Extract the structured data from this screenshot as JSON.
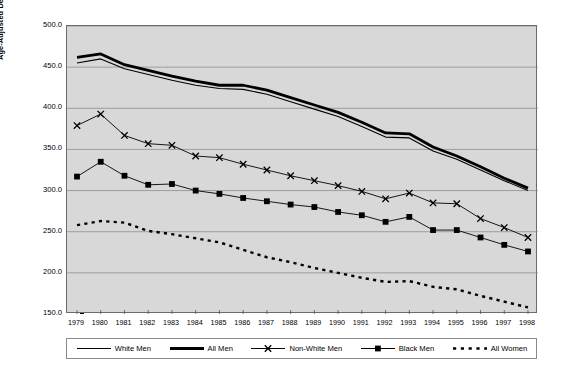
{
  "chart_data": {
    "type": "line",
    "title": "",
    "xlabel": "",
    "ylabel": "Age-Adjusted Death Rate per 100,000 Population",
    "x": [
      1979,
      1980,
      1981,
      1982,
      1983,
      1984,
      1985,
      1986,
      1987,
      1988,
      1989,
      1990,
      1991,
      1992,
      1993,
      1994,
      1995,
      1996,
      1997,
      1998
    ],
    "xtick_labels": [
      "1979",
      "1980",
      "1981",
      "1982",
      "1983",
      "1984",
      "1985",
      "1986",
      "1987",
      "1988",
      "1989",
      "1990",
      "1991",
      "1992",
      "1993",
      "1994",
      "1995",
      "1996",
      "1997",
      "1998"
    ],
    "ytick_labels": [
      "500.0",
      "450.0",
      "400.0",
      "350.0",
      "300.0",
      "250.0",
      "200.0",
      "150.0"
    ],
    "ytick_values": [
      500,
      450,
      400,
      350,
      300,
      250,
      200,
      150
    ],
    "ylim": [
      150,
      500
    ],
    "xlim": [
      1979,
      1998
    ],
    "grid": "horizontal",
    "legend_position": "bottom",
    "plot_background": "#d8d8d8",
    "series": [
      {
        "name": "White Men",
        "style": "thin-line",
        "color": "#000000",
        "values": [
          455,
          460,
          448,
          441,
          434,
          428,
          424,
          423,
          417,
          408,
          399,
          390,
          378,
          365,
          364,
          348,
          338,
          325,
          312,
          300
        ]
      },
      {
        "name": "All Men",
        "style": "thick-line",
        "color": "#000000",
        "values": [
          462,
          466,
          453,
          446,
          439,
          433,
          428,
          428,
          422,
          413,
          404,
          395,
          383,
          370,
          369,
          353,
          342,
          329,
          315,
          303
        ]
      },
      {
        "name": "Non-White Men",
        "style": "line-x-marker",
        "color": "#000000",
        "values": [
          379,
          393,
          367,
          357,
          355,
          342,
          340,
          332,
          325,
          318,
          312,
          306,
          299,
          290,
          297,
          285,
          284,
          266,
          255,
          243
        ]
      },
      {
        "name": "Black Men",
        "style": "line-square-marker",
        "color": "#000000",
        "values": [
          317,
          335,
          318,
          307,
          308,
          300,
          296,
          291,
          287,
          283,
          280,
          274,
          270,
          262,
          268,
          252,
          252,
          243,
          234,
          226
        ]
      },
      {
        "name": "All Women",
        "style": "dotted-line",
        "color": "#000000",
        "values": [
          258,
          263,
          261,
          251,
          247,
          242,
          237,
          228,
          219,
          213,
          206,
          200,
          194,
          189,
          190,
          183,
          180,
          172,
          165,
          158
        ]
      }
    ]
  }
}
